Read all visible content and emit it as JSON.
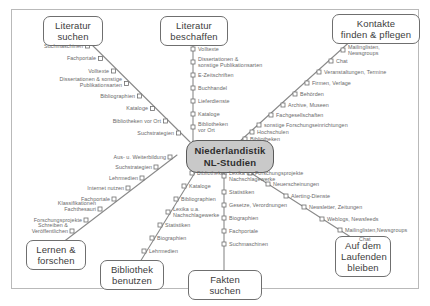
{
  "diagram": {
    "title_hub": "Niederlandistik\nNL-Studien",
    "hub_color": "#c9c9c9",
    "line_color": "#8a8a8a",
    "label_color": "#6a6a6a",
    "frame_color": "#b9b9b9",
    "background": "#ffffff"
  },
  "termini": [
    {
      "id": "literatur-suchen",
      "label": "Literatur\nsuchen"
    },
    {
      "id": "literatur-beschaffen",
      "label": "Literatur\nbeschaffen"
    },
    {
      "id": "kontakte-finden-pflegen",
      "label": "Kontakte\nfinden & pflegen"
    },
    {
      "id": "lernen-forschen",
      "label": "Lernen &\nforschen"
    },
    {
      "id": "bibliothek-benutzen",
      "label": "Bibliothek\nbenutzen"
    },
    {
      "id": "fakten-suchen",
      "label": "Fakten suchen"
    },
    {
      "id": "auf-dem-laufenden",
      "label": "Auf dem\nLaufenden\nbleiben"
    }
  ],
  "lines": [
    {
      "id": "literatur-suchen",
      "terminus": "Literatur suchen",
      "stops": [
        "Suchmaschinen",
        "Fachportale",
        "Volltexte",
        "Dissertationen & sonstige\nPublikationsarten",
        "Bibliographien",
        "Kataloge",
        "Bibliotheken vor Ort",
        "Suchstrategien"
      ]
    },
    {
      "id": "literatur-beschaffen",
      "terminus": "Literatur beschaffen",
      "stops": [
        "Volltexte",
        "Dissertationen &\nsonstige Publikationsarten",
        "E-Zeitschriften",
        "Buchhandel",
        "Lieferdienste",
        "Kataloge",
        "Bibliotheken\nvor Ort"
      ]
    },
    {
      "id": "kontakte-finden-pflegen",
      "terminus": "Kontakte finden & pflegen",
      "stops": [
        "Mailinglisten,\nNewsgroups",
        "Chat",
        "Veranstaltungen, Termine",
        "Firmen, Verlage",
        "Behörden",
        "Archive, Museen",
        "Fachgesellschaften",
        "sonstige Forschungseinrichtungen",
        "Hochschulen",
        "Bibliotheken"
      ]
    },
    {
      "id": "lernen-forschen",
      "terminus": "Lernen & forschen",
      "stops": [
        "Aus- u. Weiterbildung",
        "Suchstrategien",
        "Lehrmedien",
        "Internet nutzen",
        "Fachportale",
        "Klassifikationen\nFachthesauri",
        "Forschungsprojekte",
        "Schreiben &\nVeröffentlichen"
      ]
    },
    {
      "id": "bibliothek-benutzen",
      "terminus": "Bibliothek benutzen",
      "stops": [
        "Bibliotheken",
        "Kataloge",
        "Bibliographien",
        "Lexika u.a.\nNachschlagewerke",
        "Statistiken",
        "Biographien",
        "Lehrmedien"
      ]
    },
    {
      "id": "fakten-suchen",
      "terminus": "Fakten suchen",
      "stops": [
        "Lexika u.a.\nNachschlagewerke",
        "Statistiken",
        "Gesetze, Verordnungen",
        "Biographien",
        "Fachportale",
        "Suchmaschinen"
      ]
    },
    {
      "id": "auf-dem-laufenden",
      "terminus": "Auf dem Laufenden bleiben",
      "stops": [
        "Forschungsprojekte",
        "Neuerscheinungen",
        "Alerting-Dienste",
        "Newsletter, Zeitungen",
        "Weblogs, Newsfeeds",
        "Mailinglisten,Newsgroups",
        "Chat"
      ]
    }
  ]
}
